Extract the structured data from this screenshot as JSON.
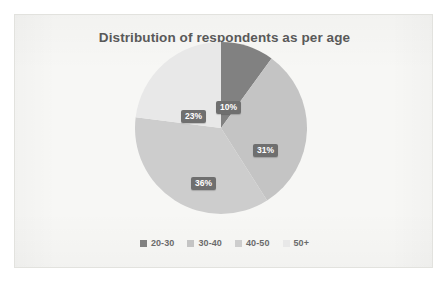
{
  "card": {
    "background_color": "#f7f7f5",
    "border_color": "#e2e2de"
  },
  "chart_data": {
    "type": "pie",
    "title": "Distribution of respondents as per age",
    "xlabel": "",
    "ylabel": "",
    "categories": [
      "20-30",
      "30-40",
      "40-50",
      "50+"
    ],
    "values": [
      10,
      31,
      36,
      23
    ],
    "value_labels": [
      "10%",
      "31%",
      "36%",
      "23%"
    ],
    "value_unit": "%",
    "colors": [
      "#818181",
      "#c4c4c4",
      "#cdcdcd",
      "#e8e8e8"
    ],
    "start_angle_deg": 0,
    "direction": "clockwise",
    "legend_position": "bottom",
    "grid": false,
    "data_label_text_color": "#ffffff",
    "data_label_background_color": "#6f6f6f",
    "slices": [
      {
        "label": "20-30",
        "value": 10,
        "value_label": "10%",
        "color": "#818181",
        "start_deg": 0,
        "end_deg": 36
      },
      {
        "label": "30-40",
        "value": 31,
        "value_label": "31%",
        "color": "#c4c4c4",
        "start_deg": 36,
        "end_deg": 147.6
      },
      {
        "label": "40-50",
        "value": 36,
        "value_label": "36%",
        "color": "#cdcdcd",
        "start_deg": 147.6,
        "end_deg": 277.2
      },
      {
        "label": "50+",
        "value": 23,
        "value_label": "23%",
        "color": "#e8e8e8",
        "start_deg": 277.2,
        "end_deg": 360
      }
    ]
  },
  "legend": {
    "items": [
      {
        "label": "20-30",
        "color": "#818181"
      },
      {
        "label": "30-40",
        "color": "#c4c4c4"
      },
      {
        "label": "40-50",
        "color": "#cdcdcd"
      },
      {
        "label": "50+",
        "color": "#e8e8e8"
      }
    ]
  }
}
